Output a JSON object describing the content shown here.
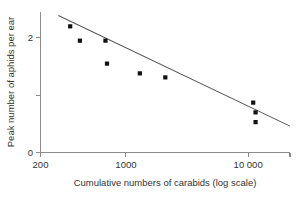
{
  "chart_data": {
    "type": "scatter",
    "title": "",
    "subtitle": "",
    "xlabel": "Cumulative numbers of carabids (log scale)",
    "ylabel": "Peak number of aphids per ear",
    "xscale": "log",
    "yscale": "linear",
    "xlim": [
      200,
      22000
    ],
    "ylim": [
      0,
      2.45
    ],
    "grid": false,
    "legend": null,
    "x_ticks": [
      {
        "value": 200,
        "label": "200"
      },
      {
        "value": 1000,
        "label": "1000"
      },
      {
        "value": 10000,
        "label": "10 000"
      },
      {
        "value": 22000,
        "label": ""
      }
    ],
    "y_ticks": [
      {
        "value": 0,
        "label": "0"
      },
      {
        "value": 1,
        "label": ""
      },
      {
        "value": 2,
        "label": "2"
      }
    ],
    "x": [
      350,
      420,
      680,
      700,
      1300,
      2100,
      11000,
      11500,
      11500
    ],
    "y": [
      2.2,
      1.95,
      1.95,
      1.55,
      1.38,
      1.31,
      0.87,
      0.7,
      0.53
    ],
    "points": [
      {
        "x": 350,
        "y": 2.2
      },
      {
        "x": 420,
        "y": 1.95
      },
      {
        "x": 680,
        "y": 1.95
      },
      {
        "x": 700,
        "y": 1.55
      },
      {
        "x": 1300,
        "y": 1.38
      },
      {
        "x": 2100,
        "y": 1.31
      },
      {
        "x": 11000,
        "y": 0.87
      },
      {
        "x": 11500,
        "y": 0.7
      },
      {
        "x": 11500,
        "y": 0.53
      }
    ],
    "trendline": {
      "name": "fitted regression line",
      "x_start": 280,
      "y_start": 2.39,
      "x_end": 22000,
      "y_end": 0.46
    },
    "marker_color": "#111111",
    "line_color": "#555555",
    "axis_color": "#8c8c8c",
    "background_color": "#ffffff"
  }
}
